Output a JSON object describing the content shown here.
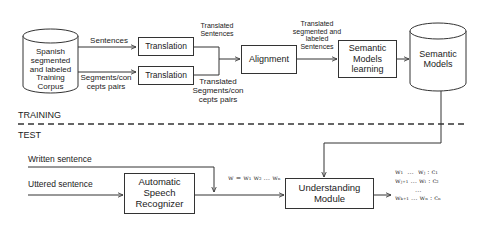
{
  "phases": {
    "training": "TRAINING",
    "test": "TEST"
  },
  "training": {
    "corpus": {
      "label": "Spanish\nsegmented\nand labeled\nTraining\nCorpus",
      "shape": "cylinder"
    },
    "edges": {
      "sentences": "Sentences",
      "segment_concept_pairs": "Segments/con\ncepts pairs",
      "translated_sentences": "Translated\nSentences",
      "translated_segment_pairs": "Translated\nSegments/con\ncepts pairs",
      "translated_labeled_sentences": "Translated\nsegmented and\nlabeled\nSentences"
    },
    "translation_1": "Translation",
    "translation_2": "Translation",
    "alignment": "Alignment",
    "learning": "Semantic\nModels\nlearning",
    "models": {
      "label": "Semantic\nModels",
      "shape": "cylinder"
    }
  },
  "test": {
    "inputs": {
      "written": "Written sentence",
      "uttered": "Uttered sentence"
    },
    "asr": "Automatic\nSpeech\nRecognizer",
    "word_sequence": "w = w₁ w₂ … wₙ",
    "understanding": "Understanding\nModule",
    "output": [
      "w₁  …  wⱼ : c₁",
      "wⱼ₊₁ … wₗ : c₂",
      "…",
      "wₖ₊₁ … wₙ : cₙ"
    ]
  },
  "colors": {
    "line": "#333333",
    "text": "#222222",
    "background": "#ffffff"
  }
}
